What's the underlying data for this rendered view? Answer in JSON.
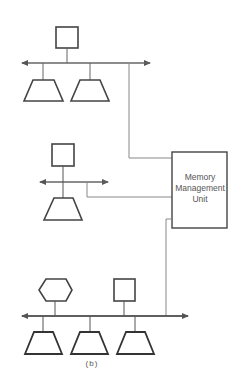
{
  "diagram": {
    "mmu": {
      "lines": [
        "Memory",
        "Management",
        "Unit"
      ]
    },
    "caption": "(b)",
    "colors": {
      "stroke": "#444444",
      "thin": "#777777",
      "background": "#ffffff"
    }
  }
}
